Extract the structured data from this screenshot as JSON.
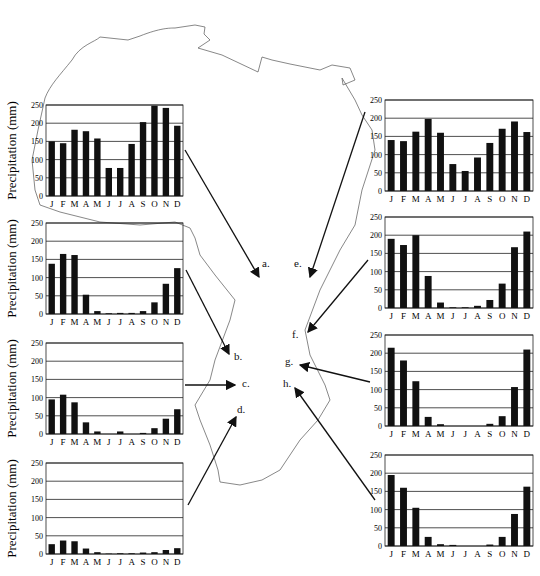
{
  "figure": {
    "ylabel": "Precipitation (mm)",
    "months": [
      "J",
      "F",
      "M",
      "A",
      "M",
      "J",
      "J",
      "A",
      "S",
      "O",
      "N",
      "D"
    ],
    "yticks": [
      0,
      50,
      100,
      150,
      200,
      250
    ]
  },
  "sites": [
    {
      "id": "a",
      "label": "a."
    },
    {
      "id": "b",
      "label": "b."
    },
    {
      "id": "c",
      "label": "c."
    },
    {
      "id": "d",
      "label": "d."
    },
    {
      "id": "e",
      "label": "e."
    },
    {
      "id": "f",
      "label": "f."
    },
    {
      "id": "g",
      "label": "g."
    },
    {
      "id": "h",
      "label": "h."
    }
  ],
  "chart_data": [
    {
      "type": "bar",
      "panel": "left-1",
      "site": "a",
      "title": "",
      "xlabel": "",
      "ylabel": "Precipitation (mm)",
      "ylim": [
        0,
        250
      ],
      "categories": [
        "J",
        "F",
        "M",
        "A",
        "M",
        "J",
        "J",
        "A",
        "S",
        "O",
        "N",
        "D"
      ],
      "values": [
        150,
        145,
        182,
        178,
        158,
        77,
        77,
        143,
        203,
        248,
        242,
        193
      ]
    },
    {
      "type": "bar",
      "panel": "left-2",
      "site": "b",
      "title": "",
      "xlabel": "",
      "ylabel": "Precipitation (mm)",
      "ylim": [
        0,
        250
      ],
      "categories": [
        "J",
        "F",
        "M",
        "A",
        "M",
        "J",
        "J",
        "A",
        "S",
        "O",
        "N",
        "D"
      ],
      "values": [
        138,
        165,
        162,
        53,
        8,
        2,
        3,
        3,
        8,
        32,
        83,
        126
      ]
    },
    {
      "type": "bar",
      "panel": "left-3",
      "site": "c",
      "title": "",
      "xlabel": "",
      "ylabel": "Precipitation (mm)",
      "ylim": [
        0,
        250
      ],
      "categories": [
        "J",
        "F",
        "M",
        "A",
        "M",
        "J",
        "J",
        "A",
        "S",
        "O",
        "N",
        "D"
      ],
      "values": [
        95,
        108,
        87,
        32,
        7,
        0,
        7,
        0,
        3,
        16,
        42,
        68
      ]
    },
    {
      "type": "bar",
      "panel": "left-4",
      "site": "d",
      "title": "",
      "xlabel": "",
      "ylabel": "Precipitation (mm)",
      "ylim": [
        0,
        250
      ],
      "categories": [
        "J",
        "F",
        "M",
        "A",
        "M",
        "J",
        "J",
        "A",
        "S",
        "O",
        "N",
        "D"
      ],
      "values": [
        27,
        37,
        35,
        15,
        5,
        1,
        2,
        2,
        4,
        5,
        11,
        16
      ]
    },
    {
      "type": "bar",
      "panel": "right-1",
      "site": "e",
      "title": "",
      "xlabel": "",
      "ylabel": "",
      "ylim": [
        0,
        250
      ],
      "categories": [
        "J",
        "F",
        "M",
        "A",
        "M",
        "J",
        "J",
        "A",
        "S",
        "O",
        "N",
        "D"
      ],
      "values": [
        140,
        137,
        163,
        198,
        160,
        74,
        55,
        92,
        132,
        171,
        191,
        162
      ]
    },
    {
      "type": "bar",
      "panel": "right-2",
      "site": "f",
      "title": "",
      "xlabel": "",
      "ylabel": "",
      "ylim": [
        0,
        250
      ],
      "categories": [
        "J",
        "F",
        "M",
        "A",
        "M",
        "J",
        "J",
        "A",
        "S",
        "O",
        "N",
        "D"
      ],
      "values": [
        190,
        173,
        200,
        88,
        15,
        2,
        2,
        6,
        22,
        67,
        167,
        210
      ]
    },
    {
      "type": "bar",
      "panel": "right-3",
      "site": "g",
      "title": "",
      "xlabel": "",
      "ylabel": "",
      "ylim": [
        0,
        250
      ],
      "categories": [
        "J",
        "F",
        "M",
        "A",
        "M",
        "J",
        "J",
        "A",
        "S",
        "O",
        "N",
        "D"
      ],
      "values": [
        215,
        180,
        123,
        25,
        5,
        0,
        0,
        0,
        6,
        27,
        107,
        210
      ]
    },
    {
      "type": "bar",
      "panel": "right-4",
      "site": "h",
      "title": "",
      "xlabel": "",
      "ylabel": "",
      "ylim": [
        0,
        250
      ],
      "categories": [
        "J",
        "F",
        "M",
        "A",
        "M",
        "J",
        "J",
        "A",
        "S",
        "O",
        "N",
        "D"
      ],
      "values": [
        195,
        160,
        105,
        25,
        5,
        3,
        0,
        0,
        4,
        25,
        88,
        163
      ]
    }
  ]
}
